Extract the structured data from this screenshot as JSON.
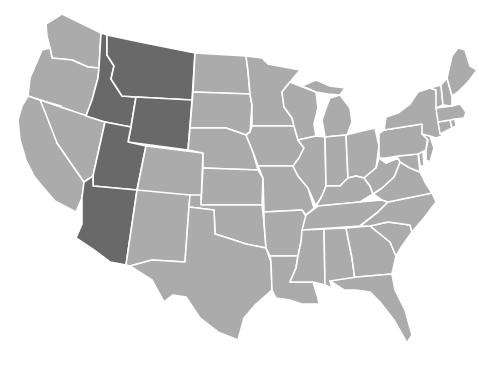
{
  "map": {
    "title": "",
    "region": "Contiguous United States",
    "colors": {
      "background": "#ffffff",
      "base_state": "#ababab",
      "highlighted_state": "#696969",
      "border": "#ffffff"
    },
    "highlighted_states": [
      "Montana",
      "Idaho",
      "Wyoming",
      "Utah",
      "Arizona"
    ],
    "states": [
      {
        "id": "WA",
        "name": "Washington",
        "highlighted": false
      },
      {
        "id": "OR",
        "name": "Oregon",
        "highlighted": false
      },
      {
        "id": "CA",
        "name": "California",
        "highlighted": false
      },
      {
        "id": "NV",
        "name": "Nevada",
        "highlighted": false
      },
      {
        "id": "ID",
        "name": "Idaho",
        "highlighted": true
      },
      {
        "id": "MT",
        "name": "Montana",
        "highlighted": true
      },
      {
        "id": "WY",
        "name": "Wyoming",
        "highlighted": true
      },
      {
        "id": "UT",
        "name": "Utah",
        "highlighted": true
      },
      {
        "id": "AZ",
        "name": "Arizona",
        "highlighted": true
      },
      {
        "id": "CO",
        "name": "Colorado",
        "highlighted": false
      },
      {
        "id": "NM",
        "name": "New Mexico",
        "highlighted": false
      },
      {
        "id": "ND",
        "name": "North Dakota",
        "highlighted": false
      },
      {
        "id": "SD",
        "name": "South Dakota",
        "highlighted": false
      },
      {
        "id": "NE",
        "name": "Nebraska",
        "highlighted": false
      },
      {
        "id": "KS",
        "name": "Kansas",
        "highlighted": false
      },
      {
        "id": "OK",
        "name": "Oklahoma",
        "highlighted": false
      },
      {
        "id": "TX",
        "name": "Texas",
        "highlighted": false
      },
      {
        "id": "MN",
        "name": "Minnesota",
        "highlighted": false
      },
      {
        "id": "IA",
        "name": "Iowa",
        "highlighted": false
      },
      {
        "id": "MO",
        "name": "Missouri",
        "highlighted": false
      },
      {
        "id": "AR",
        "name": "Arkansas",
        "highlighted": false
      },
      {
        "id": "LA",
        "name": "Louisiana",
        "highlighted": false
      },
      {
        "id": "WI",
        "name": "Wisconsin",
        "highlighted": false
      },
      {
        "id": "IL",
        "name": "Illinois",
        "highlighted": false
      },
      {
        "id": "MI",
        "name": "Michigan",
        "highlighted": false
      },
      {
        "id": "IN",
        "name": "Indiana",
        "highlighted": false
      },
      {
        "id": "OH",
        "name": "Ohio",
        "highlighted": false
      },
      {
        "id": "KY",
        "name": "Kentucky",
        "highlighted": false
      },
      {
        "id": "TN",
        "name": "Tennessee",
        "highlighted": false
      },
      {
        "id": "MS",
        "name": "Mississippi",
        "highlighted": false
      },
      {
        "id": "AL",
        "name": "Alabama",
        "highlighted": false
      },
      {
        "id": "GA",
        "name": "Georgia",
        "highlighted": false
      },
      {
        "id": "FL",
        "name": "Florida",
        "highlighted": false
      },
      {
        "id": "SC",
        "name": "South Carolina",
        "highlighted": false
      },
      {
        "id": "NC",
        "name": "North Carolina",
        "highlighted": false
      },
      {
        "id": "VA",
        "name": "Virginia",
        "highlighted": false
      },
      {
        "id": "WV",
        "name": "West Virginia",
        "highlighted": false
      },
      {
        "id": "MD",
        "name": "Maryland",
        "highlighted": false
      },
      {
        "id": "DE",
        "name": "Delaware",
        "highlighted": false
      },
      {
        "id": "PA",
        "name": "Pennsylvania",
        "highlighted": false
      },
      {
        "id": "NJ",
        "name": "New Jersey",
        "highlighted": false
      },
      {
        "id": "NY",
        "name": "New York",
        "highlighted": false
      },
      {
        "id": "CT",
        "name": "Connecticut",
        "highlighted": false
      },
      {
        "id": "RI",
        "name": "Rhode Island",
        "highlighted": false
      },
      {
        "id": "MA",
        "name": "Massachusetts",
        "highlighted": false
      },
      {
        "id": "VT",
        "name": "Vermont",
        "highlighted": false
      },
      {
        "id": "NH",
        "name": "New Hampshire",
        "highlighted": false
      },
      {
        "id": "ME",
        "name": "Maine",
        "highlighted": false
      }
    ]
  }
}
